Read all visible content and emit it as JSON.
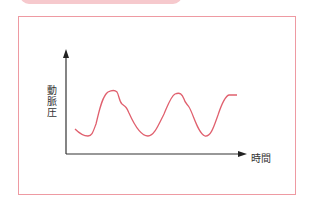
{
  "header": {
    "tab_color": "#f6c9cd"
  },
  "figure": {
    "border_color": "#ee9aa2",
    "axis_color": "#333333",
    "curve_color": "#e0606e",
    "y_axis_label": "動脈圧",
    "x_axis_label": "時間"
  }
}
